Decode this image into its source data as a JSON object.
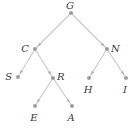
{
  "diagram": {
    "type": "binary-tree",
    "root": "G",
    "nodes": [
      {
        "id": "G",
        "label": "G",
        "x": 71,
        "y": 13,
        "lx": 70,
        "ly": 9,
        "anchor": "middle"
      },
      {
        "id": "C",
        "label": "C",
        "x": 35,
        "y": 49,
        "lx": 29,
        "ly": 52,
        "anchor": "end"
      },
      {
        "id": "N",
        "label": "N",
        "x": 107,
        "y": 49,
        "lx": 111,
        "ly": 52,
        "anchor": "start"
      },
      {
        "id": "S",
        "label": "S",
        "x": 18,
        "y": 77,
        "lx": 12,
        "ly": 80,
        "anchor": "end"
      },
      {
        "id": "R",
        "label": "R",
        "x": 53,
        "y": 78,
        "lx": 57,
        "ly": 80,
        "anchor": "start"
      },
      {
        "id": "H",
        "label": "H",
        "x": 89,
        "y": 78,
        "lx": 88,
        "ly": 93,
        "anchor": "middle"
      },
      {
        "id": "I",
        "label": "I",
        "x": 126,
        "y": 78,
        "lx": 125,
        "ly": 93,
        "anchor": "middle"
      },
      {
        "id": "E",
        "label": "E",
        "x": 35,
        "y": 106,
        "lx": 34,
        "ly": 121,
        "anchor": "middle"
      },
      {
        "id": "A",
        "label": "A",
        "x": 72,
        "y": 106,
        "lx": 71,
        "ly": 121,
        "anchor": "middle"
      }
    ],
    "edges": [
      {
        "from": "G",
        "to": "C"
      },
      {
        "from": "G",
        "to": "N"
      },
      {
        "from": "C",
        "to": "S"
      },
      {
        "from": "C",
        "to": "R"
      },
      {
        "from": "N",
        "to": "H"
      },
      {
        "from": "N",
        "to": "I"
      },
      {
        "from": "R",
        "to": "E"
      },
      {
        "from": "R",
        "to": "A"
      }
    ],
    "colors": {
      "edge": "#c8c8c8",
      "node": "#9a9a9a",
      "label": "#3a3a3a"
    }
  }
}
